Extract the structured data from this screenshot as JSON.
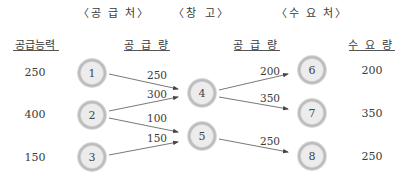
{
  "sections": {
    "supply": "〈공 급 처〉",
    "warehouse_left": "〈창",
    "warehouse_right": "고〉",
    "demand": "〈수 요 처〉"
  },
  "columns": {
    "supply_capacity": "공급능력",
    "supply_amount_left": "공 급 량",
    "supply_amount_right": "공 급 량",
    "demand_amount": "수 요 량"
  },
  "supply_capacity_values": [
    "250",
    "400",
    "150"
  ],
  "demand_values": [
    "200",
    "350",
    "250"
  ],
  "nodes": [
    {
      "id": "1",
      "x": 92,
      "y": 73
    },
    {
      "id": "2",
      "x": 92,
      "y": 115
    },
    {
      "id": "3",
      "x": 92,
      "y": 157
    },
    {
      "id": "4",
      "x": 202,
      "y": 93
    },
    {
      "id": "5",
      "x": 202,
      "y": 136
    },
    {
      "id": "6",
      "x": 312,
      "y": 70
    },
    {
      "id": "7",
      "x": 312,
      "y": 113
    },
    {
      "id": "8",
      "x": 312,
      "y": 156
    }
  ],
  "edges": [
    {
      "from": "1",
      "to": "4",
      "label": "250"
    },
    {
      "from": "2",
      "to": "4",
      "label": "300"
    },
    {
      "from": "2",
      "to": "5",
      "label": "100"
    },
    {
      "from": "3",
      "to": "5",
      "label": "150"
    },
    {
      "from": "4",
      "to": "6",
      "label": "200"
    },
    {
      "from": "4",
      "to": "7",
      "label": "350"
    },
    {
      "from": "5",
      "to": "8",
      "label": "250"
    }
  ],
  "colors": {
    "node_fill": "#ececec",
    "node_ring": "#b5b5b5",
    "edge": "#555555",
    "text": "#3a3a3a"
  }
}
